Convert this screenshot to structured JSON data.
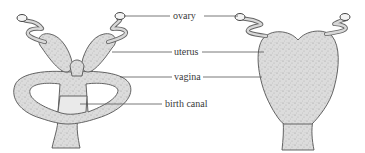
{
  "figure": {
    "type": "anatomical-comparison",
    "labels": {
      "ovary": "ovary",
      "uterus": "uterus",
      "vagina": "vagina",
      "birth_canal": "birth canal"
    },
    "left_specimen": {
      "parts": [
        "ovary",
        "uterus",
        "vagina",
        "birth canal"
      ]
    },
    "right_specimen": {
      "parts": [
        "ovary",
        "uterus",
        "vagina"
      ]
    },
    "colors": {
      "stroke": "#555555",
      "fill": "#d6d6d6",
      "label_text": "#3a3a3a",
      "background": "#ffffff"
    }
  }
}
